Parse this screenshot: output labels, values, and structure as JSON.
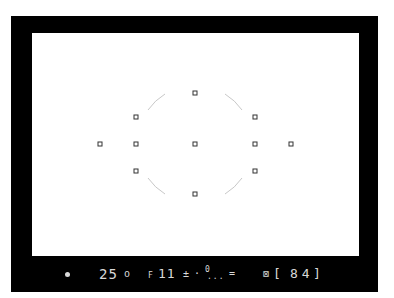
{
  "viewfinder": {
    "frame_color": "#000000",
    "screen_color": "#ffffff",
    "lcd_color": "#d8d8d8",
    "focus_points": [
      {
        "name": "top",
        "x": 195,
        "y": 93
      },
      {
        "name": "upper-left",
        "x": 136,
        "y": 117
      },
      {
        "name": "upper-right",
        "x": 255,
        "y": 117
      },
      {
        "name": "far-left",
        "x": 100,
        "y": 144
      },
      {
        "name": "mid-left",
        "x": 136,
        "y": 144
      },
      {
        "name": "center",
        "x": 195,
        "y": 144
      },
      {
        "name": "mid-right",
        "x": 255,
        "y": 144
      },
      {
        "name": "far-right",
        "x": 291,
        "y": 144
      },
      {
        "name": "lower-left",
        "x": 136,
        "y": 171
      },
      {
        "name": "lower-right",
        "x": 255,
        "y": 171
      },
      {
        "name": "bottom",
        "x": 195,
        "y": 194
      }
    ],
    "metering_circle": {
      "cx": 195,
      "cy": 144,
      "r": 57
    }
  },
  "lcd": {
    "focus_indicator": "•",
    "shutter_speed": "25",
    "shutter_suffix": "o",
    "aperture_prefix": "F",
    "aperture": "11",
    "exposure_comp_icon": "±",
    "separator": "·",
    "meter_icon": "0",
    "meter_scale": "...",
    "flash_icon": "=",
    "bracket_icon": "⊠",
    "frame_bracket_open": "[",
    "frame_count": "84",
    "frame_bracket_close": "]"
  }
}
